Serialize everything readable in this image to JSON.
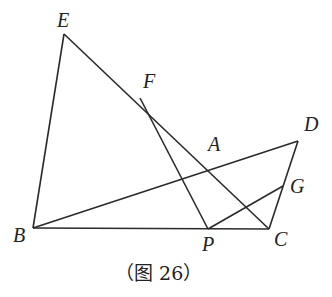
{
  "figure": {
    "caption": "（图 26）",
    "points": {
      "E": {
        "label": "E",
        "x": 64,
        "y": 34
      },
      "F": {
        "label": "F",
        "x": 140,
        "y": 98
      },
      "A": {
        "label": "A",
        "x": 209,
        "y": 160
      },
      "D": {
        "label": "D",
        "x": 298,
        "y": 141
      },
      "G": {
        "label": "G",
        "x": 283,
        "y": 186
      },
      "B": {
        "label": "B",
        "x": 33,
        "y": 228
      },
      "P": {
        "label": "P",
        "x": 208,
        "y": 229
      },
      "C": {
        "label": "C",
        "x": 269,
        "y": 229
      }
    },
    "segments": [
      "EB",
      "EC",
      "BC",
      "BD",
      "DC",
      "FP",
      "PG"
    ]
  }
}
